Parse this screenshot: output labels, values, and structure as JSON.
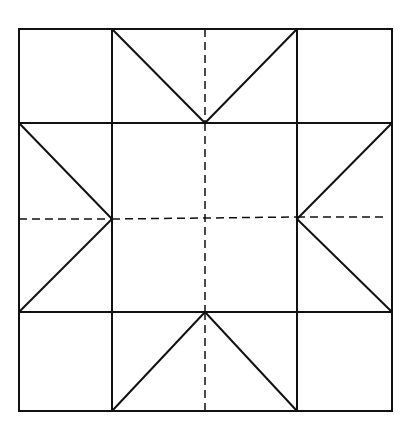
{
  "diagram": {
    "stroke_color": "#111111",
    "background": "#ffffff",
    "outer_square": {
      "x1": 19,
      "y1": 29,
      "x2": 392,
      "y2": 411
    },
    "grid_x": [
      19,
      112,
      297,
      392
    ],
    "grid_y": [
      29,
      123,
      312,
      411
    ],
    "center": {
      "x": 205,
      "y": 219
    }
  }
}
